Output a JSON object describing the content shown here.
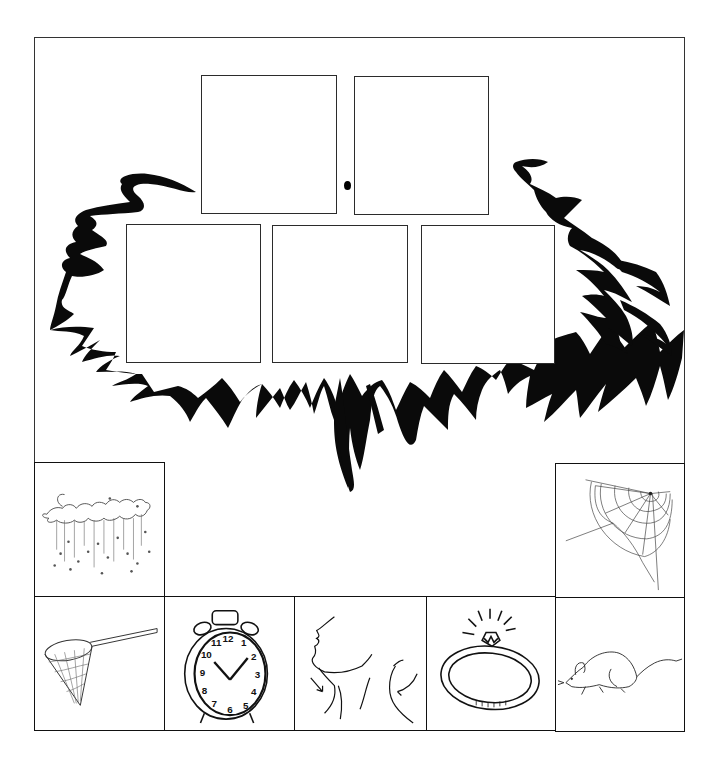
{
  "worksheet": {
    "title": "",
    "answer_boxes": {
      "top_row": [
        {
          "id": "box-1"
        },
        {
          "id": "box-2"
        }
      ],
      "middle_row": [
        {
          "id": "box-3"
        },
        {
          "id": "box-4"
        },
        {
          "id": "box-5"
        }
      ]
    },
    "picture_tiles": [
      {
        "name": "rain",
        "icon": "rain-cloud-icon",
        "position": "left-upper"
      },
      {
        "name": "spider web",
        "icon": "spider-web-icon",
        "position": "right-upper"
      },
      {
        "name": "net",
        "icon": "butterfly-net-icon",
        "position": "bottom-1"
      },
      {
        "name": "clock",
        "icon": "alarm-clock-icon",
        "position": "bottom-2"
      },
      {
        "name": "neck",
        "icon": "neck-icon",
        "position": "bottom-3"
      },
      {
        "name": "ring",
        "icon": "ring-icon",
        "position": "bottom-4"
      },
      {
        "name": "rat",
        "icon": "rat-icon",
        "position": "bottom-5"
      }
    ],
    "clock_numbers": [
      "12",
      "1",
      "2",
      "3",
      "4",
      "5",
      "6",
      "7",
      "8",
      "9",
      "10",
      "11"
    ],
    "colors": {
      "ink": "#111111",
      "paper": "#ffffff",
      "frame": "#333333"
    }
  }
}
